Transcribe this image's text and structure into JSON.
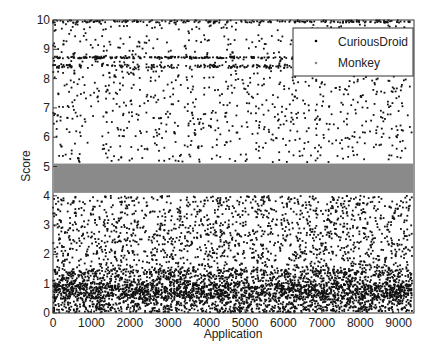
{
  "chart_data": {
    "type": "scatter",
    "title": "",
    "xlabel": "Application",
    "ylabel": "Score",
    "xlim": [
      0,
      9400
    ],
    "ylim": [
      0,
      10
    ],
    "x_ticks": [
      0,
      1000,
      2000,
      3000,
      4000,
      5000,
      6000,
      7000,
      8000,
      9000
    ],
    "y_ticks": [
      0,
      1,
      2,
      3,
      4,
      5,
      6,
      7,
      8,
      9,
      10
    ],
    "grid": false,
    "legend_position": "upper right",
    "series": [
      {
        "name": "CuriousDroid",
        "marker": "dot",
        "color": "#000000",
        "description": "About 9300 applications scattered over 0-10; densest below 1.5 (cluster near 0.8), sparser from 1.5 to 4, sparse from 5 to 10, with horizontal dense streaks near 8.4, 8.7 and 10",
        "approx_density": [
          {
            "y_range": [
              0,
              1.5
            ],
            "density": "very high"
          },
          {
            "y_range": [
              1.5,
              4
            ],
            "density": "high"
          },
          {
            "y_range": [
              5.1,
              8.2
            ],
            "density": "medium"
          },
          {
            "y_range": [
              8.2,
              8.9
            ],
            "density": "streaks at 8.4 and 8.7"
          },
          {
            "y_range": [
              8.9,
              10
            ],
            "density": "medium, streak at 10"
          }
        ]
      },
      {
        "name": "Monkey",
        "marker": "dot",
        "color": "#808080",
        "description": "Dense solid band for all applications",
        "y_range": [
          4.1,
          5.1
        ]
      }
    ]
  },
  "legend": {
    "items": [
      {
        "label": "CuriousDroid"
      },
      {
        "label": "Monkey"
      }
    ]
  },
  "axes": {
    "xlabel": "Application",
    "ylabel": "Score",
    "x_tick_labels": [
      "0",
      "1000",
      "2000",
      "3000",
      "4000",
      "5000",
      "6000",
      "7000",
      "8000",
      "9000"
    ],
    "y_tick_labels": [
      "0",
      "1",
      "2",
      "3",
      "4",
      "5",
      "6",
      "7",
      "8",
      "9",
      "10"
    ]
  }
}
